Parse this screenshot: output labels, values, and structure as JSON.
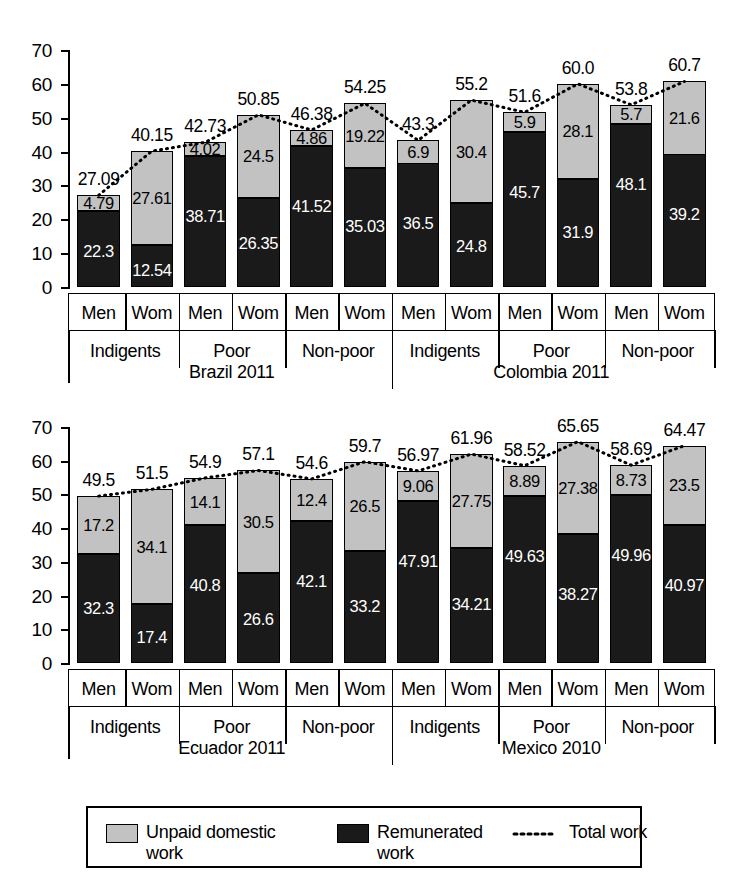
{
  "chart_data": [
    {
      "type": "bar",
      "title": "",
      "subtitle": "",
      "xlabel": "",
      "ylabel": "",
      "ylim": [
        0,
        70
      ],
      "yticks": [
        0,
        10,
        20,
        30,
        40,
        50,
        60,
        70
      ],
      "ytick_labels": [
        "0",
        "10",
        "20",
        "30",
        "40",
        "50",
        "60",
        "70"
      ],
      "grid": false,
      "legend_position": "bottom",
      "groups": [
        {
          "country": "Brazil 2011",
          "strata": [
            {
              "label": "Indigents",
              "bars": [
                {
                  "sex": "Men",
                  "remunerated": 22.3,
                  "unpaid": 4.79,
                  "total": 27.09
                },
                {
                  "sex": "Wom",
                  "remunerated": 12.54,
                  "unpaid": 27.61,
                  "total": 40.15
                }
              ]
            },
            {
              "label": "Poor",
              "bars": [
                {
                  "sex": "Men",
                  "remunerated": 38.71,
                  "unpaid": 4.02,
                  "total": 42.73
                },
                {
                  "sex": "Wom",
                  "remunerated": 26.35,
                  "unpaid": 24.5,
                  "total": 50.85
                }
              ]
            },
            {
              "label": "Non-poor",
              "bars": [
                {
                  "sex": "Men",
                  "remunerated": 41.52,
                  "unpaid": 4.86,
                  "total": 46.38
                },
                {
                  "sex": "Wom",
                  "remunerated": 35.03,
                  "unpaid": 19.22,
                  "total": 54.25
                }
              ]
            }
          ]
        },
        {
          "country": "Colombia 2011",
          "strata": [
            {
              "label": "Indigents",
              "bars": [
                {
                  "sex": "Men",
                  "remunerated": 36.5,
                  "unpaid": 6.9,
                  "total": 43.3
                },
                {
                  "sex": "Wom",
                  "remunerated": 24.8,
                  "unpaid": 30.4,
                  "total": 55.2
                }
              ]
            },
            {
              "label": "Poor",
              "bars": [
                {
                  "sex": "Men",
                  "remunerated": 45.7,
                  "unpaid": 5.9,
                  "total": 51.6
                },
                {
                  "sex": "Wom",
                  "remunerated": 31.9,
                  "unpaid": 28.1,
                  "total": 60.0
                }
              ]
            },
            {
              "label": "Non-poor",
              "bars": [
                {
                  "sex": "Men",
                  "remunerated": 48.1,
                  "unpaid": 5.7,
                  "total": 53.8
                },
                {
                  "sex": "Wom",
                  "remunerated": 39.2,
                  "unpaid": 21.6,
                  "total": 60.7
                }
              ]
            }
          ]
        }
      ]
    },
    {
      "type": "bar",
      "title": "",
      "subtitle": "",
      "xlabel": "",
      "ylabel": "",
      "ylim": [
        0,
        70
      ],
      "yticks": [
        0,
        10,
        20,
        30,
        40,
        50,
        60,
        70
      ],
      "ytick_labels": [
        "0",
        "10",
        "20",
        "30",
        "40",
        "50",
        "60",
        "70"
      ],
      "grid": false,
      "legend_position": "bottom",
      "groups": [
        {
          "country": "Ecuador 2011",
          "strata": [
            {
              "label": "Indigents",
              "bars": [
                {
                  "sex": "Men",
                  "remunerated": 32.3,
                  "unpaid": 17.2,
                  "total": 49.5
                },
                {
                  "sex": "Wom",
                  "remunerated": 17.4,
                  "unpaid": 34.1,
                  "total": 51.5
                }
              ]
            },
            {
              "label": "Poor",
              "bars": [
                {
                  "sex": "Men",
                  "remunerated": 40.8,
                  "unpaid": 14.1,
                  "total": 54.9
                },
                {
                  "sex": "Wom",
                  "remunerated": 26.6,
                  "unpaid": 30.5,
                  "total": 57.1
                }
              ]
            },
            {
              "label": "Non-poor",
              "bars": [
                {
                  "sex": "Men",
                  "remunerated": 42.1,
                  "unpaid": 12.4,
                  "total": 54.6
                },
                {
                  "sex": "Wom",
                  "remunerated": 33.2,
                  "unpaid": 26.5,
                  "total": 59.7
                }
              ]
            }
          ]
        },
        {
          "country": "Mexico 2010",
          "strata": [
            {
              "label": "Indigents",
              "bars": [
                {
                  "sex": "Men",
                  "remunerated": 47.91,
                  "unpaid": 9.06,
                  "total": 56.97
                },
                {
                  "sex": "Wom",
                  "remunerated": 34.21,
                  "unpaid": 27.75,
                  "total": 61.96
                }
              ]
            },
            {
              "label": "Poor",
              "bars": [
                {
                  "sex": "Men",
                  "remunerated": 49.63,
                  "unpaid": 8.89,
                  "total": 58.52
                },
                {
                  "sex": "Wom",
                  "remunerated": 38.27,
                  "unpaid": 27.38,
                  "total": 65.65
                }
              ]
            },
            {
              "label": "Non-poor",
              "bars": [
                {
                  "sex": "Men",
                  "remunerated": 49.96,
                  "unpaid": 8.73,
                  "total": 58.69
                },
                {
                  "sex": "Wom",
                  "remunerated": 40.97,
                  "unpaid": 23.5,
                  "total": 64.47
                }
              ]
            }
          ]
        }
      ]
    }
  ],
  "legend": {
    "items": [
      {
        "key": "unpaid",
        "label_line1": "Unpaid domestic",
        "label_line2": "work",
        "color": "#c2c2c2",
        "marker": "square"
      },
      {
        "key": "remunerated",
        "label_line1": "Remunerated",
        "label_line2": "work",
        "color": "#1a1a1a",
        "marker": "square"
      },
      {
        "key": "total",
        "label_line1": "Total work",
        "label_line2": "",
        "color": "#000000",
        "marker": "dotted-line"
      }
    ]
  },
  "colors": {
    "unpaid": "#c2c2c2",
    "remunerated": "#1a1a1a",
    "total_line": "#000000",
    "axis": "#000000",
    "background": "#ffffff"
  }
}
